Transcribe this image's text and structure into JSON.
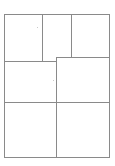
{
  "document": {
    "title": "Grid Layout Wireframe",
    "background_color": "#ffffff",
    "line_color": "#8a8a8a",
    "cell_fill_color": "#ffffff",
    "width_px": 115,
    "height_px": 166
  },
  "frame": {
    "label": "",
    "x": 4,
    "y": 14,
    "width": 106,
    "height": 144
  },
  "rows": [
    {
      "name": "top-row",
      "cell_count": 3,
      "cells": [
        {
          "name": "cell-1-1",
          "label": ""
        },
        {
          "name": "cell-1-2",
          "label": ""
        },
        {
          "name": "cell-1-3",
          "label": ""
        }
      ]
    },
    {
      "name": "middle-row",
      "cell_count": 2,
      "cells": [
        {
          "name": "cell-2-1",
          "label": ""
        },
        {
          "name": "cell-2-2",
          "label": ""
        }
      ]
    },
    {
      "name": "bottom-row",
      "cell_count": 2,
      "cells": [
        {
          "name": "cell-3-1",
          "label": ""
        },
        {
          "name": "cell-3-2",
          "label": ""
        }
      ]
    }
  ],
  "marks": [
    {
      "name": "speck-upper",
      "x": 37,
      "y": 27
    },
    {
      "name": "speck-middle",
      "x": 53,
      "y": 80
    }
  ]
}
